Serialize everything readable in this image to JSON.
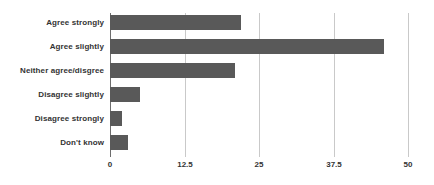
{
  "chart_data": {
    "type": "bar",
    "orientation": "horizontal",
    "title": "",
    "subtitle": "",
    "xlabel": "",
    "ylabel": "",
    "categories": [
      "Agree strongly",
      "Agree slightly",
      "Neither agree/disgree",
      "Disagree slightly",
      "Disagree strongly",
      "Don't know"
    ],
    "values": [
      22,
      46,
      21,
      5,
      2,
      3
    ],
    "xlim": [
      0,
      50
    ],
    "ylim": null,
    "xticks": [
      0,
      12.5,
      25,
      37.5,
      50
    ],
    "xtick_labels": [
      "0",
      "12.5",
      "25",
      "37.5",
      "50"
    ],
    "grid": true,
    "grid_axis": "x",
    "legend": false,
    "legend_position": "none",
    "bar_color": "#595959",
    "gridline_color": "#c9c9c9",
    "axis_color": "#6d6d6d",
    "label_color": "#333333",
    "background_color": "#ffffff",
    "data_labels": false
  }
}
